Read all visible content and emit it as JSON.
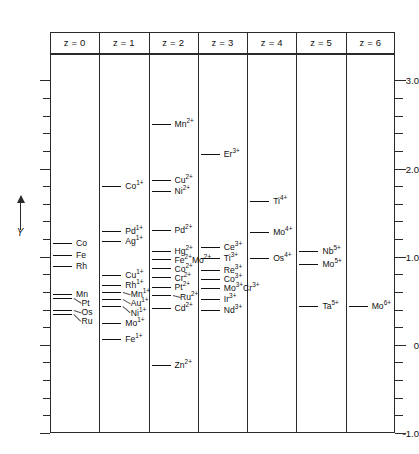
{
  "chart_data": {
    "type": "scatter",
    "title": "",
    "xlabel": "",
    "ylabel": "Y",
    "ylim": [
      -1.0,
      3.3
    ],
    "yticks": [
      3.0,
      2.0,
      1.0,
      0,
      -1.0
    ],
    "ytick_labels": [
      "3.0",
      "2.0",
      "1.0",
      "0",
      "-1.0"
    ],
    "minor_tick_step": 0.2,
    "grid": false,
    "legend": "none",
    "categories": [
      "z = 0",
      "z = 1",
      "z = 2",
      "z = 3",
      "z = 4",
      "z = 5",
      "z = 6"
    ],
    "note": "Horizontal level marks per charge-state column; leader lines connect marks to species labels.",
    "columns": [
      {
        "header": "z = 0",
        "levels": [
          {
            "species": "Co",
            "charge": "",
            "y": 1.16
          },
          {
            "species": "Fe",
            "charge": "",
            "y": 1.02
          },
          {
            "species": "Rh",
            "charge": "",
            "y": 0.89
          },
          {
            "species": "Mn",
            "charge": "",
            "y": 0.58
          },
          {
            "species": "Pt",
            "charge": "",
            "y": 0.53
          },
          {
            "species": "Os",
            "charge": "",
            "y": 0.4
          },
          {
            "species": "Ru",
            "charge": "",
            "y": 0.35
          }
        ]
      },
      {
        "header": "z = 1",
        "levels": [
          {
            "species": "Co",
            "charge": "1+",
            "y": 1.8
          },
          {
            "species": "Pd",
            "charge": "1+",
            "y": 1.29
          },
          {
            "species": "Ag",
            "charge": "1+",
            "y": 1.18
          },
          {
            "species": "Cu",
            "charge": "1+",
            "y": 0.79
          },
          {
            "species": "Rh",
            "charge": "1+",
            "y": 0.68
          },
          {
            "species": "Mn",
            "charge": "1+",
            "y": 0.6
          },
          {
            "species": "Au",
            "charge": "1+",
            "y": 0.52
          },
          {
            "species": "Ni",
            "charge": "1+",
            "y": 0.44
          },
          {
            "species": "Mo",
            "charge": "1+",
            "y": 0.25
          },
          {
            "species": "Fe",
            "charge": "1+",
            "y": 0.07
          }
        ]
      },
      {
        "header": "z = 2",
        "levels": [
          {
            "species": "Mn",
            "charge": "2+",
            "y": 2.51
          },
          {
            "species": "Cu",
            "charge": "2+",
            "y": 1.87
          },
          {
            "species": "Ni",
            "charge": "2+",
            "y": 1.75
          },
          {
            "species": "Pd",
            "charge": "2+",
            "y": 1.3
          },
          {
            "species": "Hg",
            "charge": "2+",
            "y": 1.07
          },
          {
            "species": "Fe",
            "charge": "2+",
            "y": 0.97
          },
          {
            "species": "Mo",
            "charge": "2+",
            "y": 0.97
          },
          {
            "species": "Co",
            "charge": "2+",
            "y": 0.87
          },
          {
            "species": "Cr",
            "charge": "2+",
            "y": 0.77
          },
          {
            "species": "Pt",
            "charge": "2+",
            "y": 0.66
          },
          {
            "species": "Ru",
            "charge": "2+",
            "y": 0.57
          },
          {
            "species": "Cd",
            "charge": "2+",
            "y": 0.42
          },
          {
            "species": "Zn",
            "charge": "2+",
            "y": -0.23
          }
        ]
      },
      {
        "header": "z = 3",
        "levels": [
          {
            "species": "Er",
            "charge": "3+",
            "y": 2.16
          },
          {
            "species": "Ce",
            "charge": "3+",
            "y": 1.11
          },
          {
            "species": "Ti",
            "charge": "3+",
            "y": 0.98
          },
          {
            "species": "Re",
            "charge": "3+",
            "y": 0.85
          },
          {
            "species": "Co",
            "charge": "3+",
            "y": 0.75
          },
          {
            "species": "Mo",
            "charge": "3+",
            "y": 0.64
          },
          {
            "species": "Cr",
            "charge": "3+",
            "y": 0.64
          },
          {
            "species": "Ir",
            "charge": "3+",
            "y": 0.52
          },
          {
            "species": "Nd",
            "charge": "3+",
            "y": 0.4
          }
        ]
      },
      {
        "header": "z = 4",
        "levels": [
          {
            "species": "Ti",
            "charge": "4+",
            "y": 1.63
          },
          {
            "species": "Mo",
            "charge": "4+",
            "y": 1.28
          },
          {
            "species": "Os",
            "charge": "4+",
            "y": 0.98
          }
        ]
      },
      {
        "header": "z = 5",
        "levels": [
          {
            "species": "Nb",
            "charge": "5+",
            "y": 1.06
          },
          {
            "species": "Mo",
            "charge": "5+",
            "y": 0.92
          },
          {
            "species": "Ta",
            "charge": "5+",
            "y": 0.44
          }
        ]
      },
      {
        "header": "z = 6",
        "levels": [
          {
            "species": "Mo",
            "charge": "6+",
            "y": 0.44
          }
        ]
      }
    ]
  }
}
